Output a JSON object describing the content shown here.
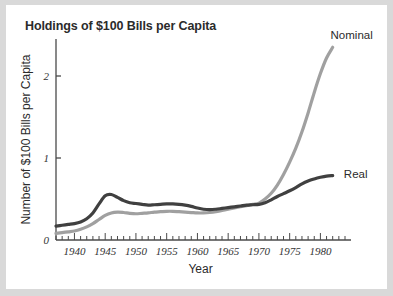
{
  "figure": {
    "title": "Holdings of $100 Bills per Capita",
    "background_color": "#d9d9d9",
    "card_color": "#ffffff"
  },
  "chart_data": {
    "type": "line",
    "title": "Holdings of $100 Bills per Capita",
    "xlabel": "Year",
    "ylabel": "Number of $100 Bills per Capita",
    "xlim": [
      1937,
      1984
    ],
    "ylim": [
      0,
      2.45
    ],
    "xticks": [
      1940,
      1945,
      1950,
      1955,
      1960,
      1965,
      1970,
      1975,
      1980
    ],
    "xtick_labels": [
      "1940",
      "1945",
      "1950",
      "1955",
      "1960",
      "1965",
      "1970",
      "1975",
      "1980"
    ],
    "minor_xtick_interval": 1,
    "yticks": [
      0,
      1,
      2
    ],
    "ytick_labels": [
      "0",
      "1",
      "2"
    ],
    "grid": false,
    "legend_position": "inline-right-of-line-end",
    "series": [
      {
        "name": "Nominal",
        "color": "#a0a0a0",
        "label_position": {
          "year": 1981,
          "value": 2.45
        },
        "x": [
          1937,
          1938,
          1939,
          1940,
          1941,
          1942,
          1943,
          1944,
          1945,
          1946,
          1947,
          1948,
          1949,
          1950,
          1951,
          1952,
          1953,
          1954,
          1955,
          1956,
          1957,
          1958,
          1959,
          1960,
          1961,
          1962,
          1963,
          1964,
          1965,
          1966,
          1967,
          1968,
          1969,
          1970,
          1971,
          1972,
          1973,
          1974,
          1975,
          1976,
          1977,
          1978,
          1979,
          1980,
          1981,
          1982
        ],
        "values": [
          0.08,
          0.09,
          0.1,
          0.11,
          0.13,
          0.16,
          0.2,
          0.25,
          0.3,
          0.33,
          0.34,
          0.335,
          0.325,
          0.32,
          0.325,
          0.33,
          0.34,
          0.345,
          0.35,
          0.35,
          0.345,
          0.34,
          0.335,
          0.33,
          0.33,
          0.335,
          0.345,
          0.36,
          0.375,
          0.39,
          0.405,
          0.42,
          0.435,
          0.45,
          0.5,
          0.57,
          0.67,
          0.8,
          0.95,
          1.12,
          1.32,
          1.55,
          1.8,
          2.03,
          2.22,
          2.35
        ]
      },
      {
        "name": "Real",
        "color": "#404040",
        "label_position": {
          "year": 1983,
          "value": 0.8
        },
        "x": [
          1937,
          1938,
          1939,
          1940,
          1941,
          1942,
          1943,
          1944,
          1945,
          1946,
          1947,
          1948,
          1949,
          1950,
          1951,
          1952,
          1953,
          1954,
          1955,
          1956,
          1957,
          1958,
          1959,
          1960,
          1961,
          1962,
          1963,
          1964,
          1965,
          1966,
          1967,
          1968,
          1969,
          1970,
          1971,
          1972,
          1973,
          1974,
          1975,
          1976,
          1977,
          1978,
          1979,
          1980,
          1981,
          1982
        ],
        "values": [
          0.17,
          0.18,
          0.19,
          0.2,
          0.22,
          0.26,
          0.33,
          0.44,
          0.54,
          0.555,
          0.52,
          0.48,
          0.455,
          0.445,
          0.435,
          0.425,
          0.43,
          0.435,
          0.44,
          0.44,
          0.435,
          0.425,
          0.41,
          0.39,
          0.375,
          0.37,
          0.375,
          0.385,
          0.395,
          0.405,
          0.415,
          0.425,
          0.43,
          0.435,
          0.455,
          0.49,
          0.53,
          0.565,
          0.6,
          0.64,
          0.685,
          0.72,
          0.745,
          0.765,
          0.78,
          0.785
        ]
      }
    ]
  }
}
